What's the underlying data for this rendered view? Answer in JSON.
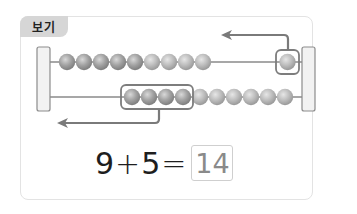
{
  "label": "보기",
  "abacus": {
    "rows": [
      {
        "beads_left": 9,
        "beads_right_boxed": 1,
        "total": 10
      },
      {
        "beads_boxed": 4,
        "beads_after": 6,
        "total": 10
      }
    ],
    "arrows": [
      {
        "from": "top-right-boxed-bead",
        "direction": "left"
      },
      {
        "from": "bottom-boxed-group",
        "direction": "left"
      }
    ]
  },
  "equation": {
    "left": "9",
    "operator": "+",
    "right": "5",
    "equals": "=",
    "answer": "14"
  },
  "colors": {
    "bead": "#a9a9a9",
    "bead_light": "#c2c2c2",
    "frame": "#f0f0f0",
    "frame_border": "#8c8c8c",
    "arrow": "#7a7a7a",
    "highlight_box": "#7d7d7d",
    "answer_box_border": "#cfcfcf"
  }
}
